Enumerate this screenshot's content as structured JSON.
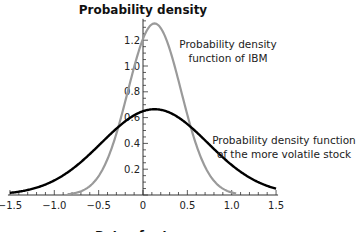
{
  "chart_data": {
    "type": "line",
    "title": "Probability density",
    "xlabel": "Rate of return",
    "ylabel": "",
    "xlim": [
      -1.5,
      1.5
    ],
    "ylim": [
      0,
      1.35
    ],
    "x_ticks": [
      -1.5,
      -1.0,
      -0.5,
      0,
      0.5,
      1.0,
      1.5
    ],
    "x_tick_labels": [
      "−1.5",
      "−1.0",
      "−0.5",
      "0",
      "0.5",
      "1.0",
      "1.5"
    ],
    "y_ticks": [
      0.2,
      0.4,
      0.6,
      0.8,
      1.0,
      1.2
    ],
    "y_tick_labels": [
      "0.2",
      "0.4",
      "0.6",
      "0.8",
      "1.0",
      "1.2"
    ],
    "x_minor_step": 0.1,
    "y_minor_step": 0.05,
    "grid": false,
    "legend": "none (inline annotations)",
    "series": [
      {
        "name": "Probability density function of IBM",
        "color": "#9a9a9a",
        "distribution": "normal",
        "mean": 0.13,
        "sd": 0.3,
        "peak": 1.33,
        "x_range": [
          -0.85,
          1.05
        ],
        "x": [
          -0.8,
          -0.6,
          -0.4,
          -0.2,
          0.0,
          0.13,
          0.2,
          0.4,
          0.6,
          0.8,
          1.0
        ],
        "values": [
          0.01,
          0.06,
          0.26,
          0.72,
          1.22,
          1.33,
          1.3,
          0.88,
          0.39,
          0.11,
          0.02
        ]
      },
      {
        "name": "Probability density function of the more volatile stock",
        "color": "#000000",
        "distribution": "normal",
        "mean": 0.13,
        "sd": 0.6,
        "peak": 0.665,
        "x_range": [
          -1.5,
          1.5
        ],
        "x": [
          -1.5,
          -1.0,
          -0.5,
          0.0,
          0.13,
          0.5,
          1.0,
          1.5
        ],
        "values": [
          0.02,
          0.12,
          0.38,
          0.65,
          0.665,
          0.6,
          0.23,
          0.05
        ]
      }
    ],
    "annotations": [
      {
        "text": [
          "Probability density",
          "function of IBM"
        ],
        "x": 0.45,
        "y": 1.18
      },
      {
        "text": [
          "Probability density function",
          "of the more volatile stock"
        ],
        "x": 0.85,
        "y": 0.55
      }
    ]
  },
  "labels": {
    "title": "Probability density",
    "xlabel": "Rate of return",
    "annot_ibm_1": "Probability density",
    "annot_ibm_2": "function of IBM",
    "annot_vol_1": "Probability density function",
    "annot_vol_2": "of the more volatile stock"
  }
}
